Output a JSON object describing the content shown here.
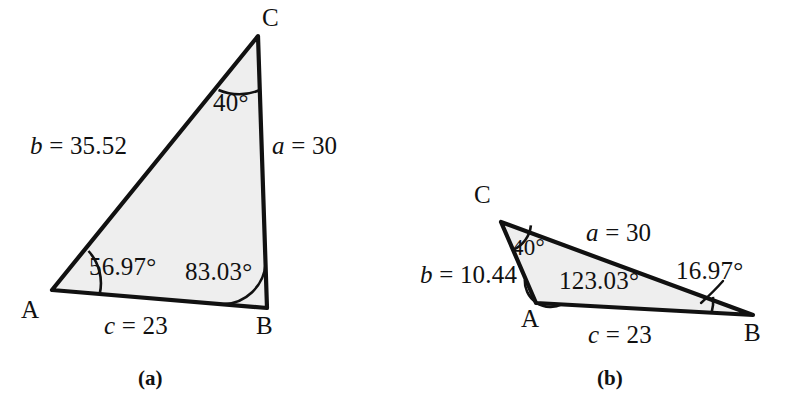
{
  "figure": {
    "kind": "geometry-diagram",
    "width": 793,
    "height": 412,
    "background_color": "#ffffff",
    "triangle_fill_color": "#eeeeee",
    "triangle_stroke_color": "#111111",
    "arc_stroke_color": "#111111",
    "text_color": "#111111"
  },
  "panels": [
    {
      "id": "panel-a",
      "caption": "(a)",
      "caption_pos": {
        "x": 138,
        "y": 368
      },
      "vertices": {
        "A": {
          "x": 52,
          "y": 290,
          "label": "A",
          "label_pos": {
            "x": 21,
            "y": 297
          }
        },
        "B": {
          "x": 267,
          "y": 308,
          "label": "B",
          "label_pos": {
            "x": 256,
            "y": 313
          }
        },
        "C": {
          "x": 258,
          "y": 36,
          "label": "C",
          "label_pos": {
            "x": 262,
            "y": 5
          }
        }
      },
      "sides": [
        {
          "name": "side-b",
          "var": "b",
          "eq": " = ",
          "value": "35.52",
          "from": "A",
          "to": "C",
          "label_pos": {
            "x": 30,
            "y": 133
          }
        },
        {
          "name": "side-a",
          "var": "a",
          "eq": " = ",
          "value": "30",
          "from": "C",
          "to": "B",
          "label_pos": {
            "x": 272,
            "y": 133
          }
        },
        {
          "name": "side-c",
          "var": "c",
          "eq": " = ",
          "value": "23",
          "from": "A",
          "to": "B",
          "label_pos": {
            "x": 104,
            "y": 313
          }
        }
      ],
      "angles": [
        {
          "name": "angle-C",
          "at": "C",
          "value": "40",
          "unit": "°",
          "label_pos": {
            "x": 213,
            "y": 90
          },
          "arc_radius": 54
        },
        {
          "name": "angle-A",
          "at": "A",
          "value": "56.97",
          "unit": "°",
          "label_pos": {
            "x": 89,
            "y": 254
          },
          "arc_radius": 48
        },
        {
          "name": "angle-B",
          "at": "B",
          "value": "83.03",
          "unit": "°",
          "label_pos": {
            "x": 185,
            "y": 259
          },
          "arc_radius": 44
        }
      ]
    },
    {
      "id": "panel-b",
      "caption": "(b)",
      "caption_pos": {
        "x": 597,
        "y": 368
      },
      "vertices": {
        "A": {
          "x": 536,
          "y": 303,
          "label": "A",
          "label_pos": {
            "x": 521,
            "y": 306
          }
        },
        "B": {
          "x": 753,
          "y": 315,
          "label": "B",
          "label_pos": {
            "x": 744,
            "y": 320
          }
        },
        "C": {
          "x": 501,
          "y": 222,
          "label": "C",
          "label_pos": {
            "x": 474,
            "y": 182
          }
        }
      },
      "sides": [
        {
          "name": "side-b",
          "var": "b",
          "eq": " = ",
          "value": "10.44",
          "from": "C",
          "to": "A",
          "label_pos": {
            "x": 420,
            "y": 262
          }
        },
        {
          "name": "side-a",
          "var": "a",
          "eq": " = ",
          "value": "30",
          "from": "C",
          "to": "B",
          "label_pos": {
            "x": 586,
            "y": 220
          }
        },
        {
          "name": "side-c",
          "var": "c",
          "eq": " = ",
          "value": "23",
          "from": "A",
          "to": "B",
          "label_pos": {
            "x": 588,
            "y": 322
          }
        }
      ],
      "angles": [
        {
          "name": "angle-C",
          "at": "C",
          "value": "40",
          "unit": "°",
          "label_pos": {
            "x": 512,
            "y": 236
          },
          "arc_radius": 30
        },
        {
          "name": "angle-A",
          "at": "A",
          "value": "123.03",
          "unit": "°",
          "label_pos": {
            "x": 559,
            "y": 268
          },
          "arc_radius": 26
        },
        {
          "name": "angle-B",
          "at": "B",
          "value": "16.97",
          "unit": "°",
          "label_pos": {
            "x": 676,
            "y": 258
          },
          "arc_radius": 42,
          "has_leader": true
        }
      ]
    }
  ]
}
